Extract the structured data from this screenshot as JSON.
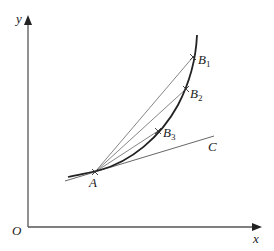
{
  "diagram": {
    "axes": {
      "y_label": "y",
      "x_label": "x",
      "origin_label": "O",
      "color": "#555555"
    },
    "curve": {
      "color": "#222222"
    },
    "points": {
      "A": {
        "label": "A"
      },
      "B1": {
        "label": "B",
        "subscript": "1"
      },
      "B2": {
        "label": "B",
        "subscript": "2"
      },
      "B3": {
        "label": "B",
        "subscript": "3"
      }
    },
    "tangent": {
      "label": "C",
      "color": "#555555"
    },
    "secant_color": "#666666"
  }
}
